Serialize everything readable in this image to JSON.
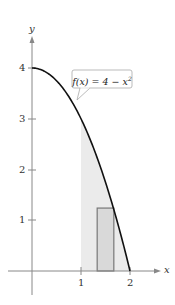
{
  "chart_data": {
    "type": "area",
    "title": "",
    "function_label": "f(x) = 4 − x²",
    "function_label_parts": {
      "lhs": "f(x) = 4 − x",
      "exp": "2"
    },
    "xlabel": "x",
    "ylabel": "y",
    "x_ticks": [
      1,
      2
    ],
    "y_ticks": [
      1,
      2,
      3,
      4
    ],
    "xlim": [
      -0.5,
      2.6
    ],
    "ylim": [
      -0.5,
      4.7
    ],
    "grid": false,
    "curve": {
      "expr": "4 - x^2",
      "x_from": 0,
      "x_to": 2
    },
    "shaded_region": {
      "x_from": 1,
      "x_to": 2,
      "under": "f(x)"
    },
    "rectangle": {
      "x_from": 1.33,
      "x_to": 1.67,
      "height": 1.24
    },
    "colors": {
      "curve": "#111111",
      "shade": "#ebebeb",
      "rect_fill": "#d9d9d9",
      "rect_stroke": "#777777",
      "axis": "#888888"
    }
  },
  "labels": {
    "x_axis": "x",
    "y_axis": "y",
    "xt1": "1",
    "xt2": "2",
    "yt1": "1",
    "yt2": "2",
    "yt3": "3",
    "yt4": "4"
  }
}
